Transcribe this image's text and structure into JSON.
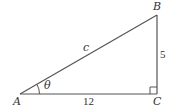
{
  "diagram": {
    "type": "right-triangle",
    "vertices": {
      "A": {
        "label": "A",
        "x": 20,
        "y": 94
      },
      "B": {
        "label": "B",
        "x": 157,
        "y": 15
      },
      "C": {
        "label": "C",
        "x": 157,
        "y": 94
      }
    },
    "sides": {
      "hypotenuse": {
        "label": "c",
        "from": "A",
        "to": "B"
      },
      "vertical": {
        "label": "5",
        "from": "C",
        "to": "B"
      },
      "horizontal": {
        "label": "12",
        "from": "A",
        "to": "C"
      }
    },
    "angle": {
      "label": "θ",
      "at": "A"
    },
    "right_angle_at": "C",
    "stroke_color": "#555555",
    "text_color": "#333333"
  }
}
